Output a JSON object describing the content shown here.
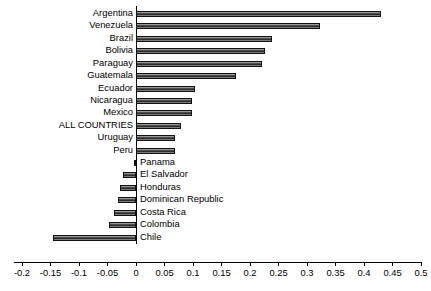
{
  "chart_data": {
    "type": "bar",
    "orientation": "horizontal",
    "title": "",
    "subtitle": "",
    "xlabel": "",
    "ylabel": "",
    "xlim": [
      -0.2,
      0.5
    ],
    "xticks": [
      -0.2,
      -0.15,
      -0.1,
      -0.05,
      0,
      0.05,
      0.1,
      0.15,
      0.2,
      0.25,
      0.3,
      0.35,
      0.4,
      0.45,
      0.5
    ],
    "xticklabels": [
      "-0.2",
      "-0.15",
      "-0.1",
      "-0.05",
      "0",
      "0.05",
      "0.1",
      "0.15",
      "0.2",
      "0.25",
      "0.3",
      "0.35",
      "0.4",
      "0.45",
      "0.5"
    ],
    "grid": false,
    "legend": null,
    "categories": [
      "Argentina",
      "Venezuela",
      "Brazil",
      "Bolivia",
      "Paraguay",
      "Guatemala",
      "Ecuador",
      "Nicaragua",
      "Mexico",
      "ALL COUNTRIES",
      "Uruguay",
      "Peru",
      "Panama",
      "El Salvador",
      "Honduras",
      "Dominican Republic",
      "Costa Rica",
      "Colombia",
      "Chile"
    ],
    "values": [
      0.43,
      0.323,
      0.239,
      0.227,
      0.221,
      0.175,
      0.104,
      0.098,
      0.098,
      0.079,
      0.068,
      0.068,
      -0.004,
      -0.023,
      -0.028,
      -0.032,
      -0.039,
      -0.048,
      -0.146
    ],
    "bar_fill_color": "#3f3f3f",
    "bar_edge_color": "#111111",
    "axis_color": "#000000",
    "background_color": "#ffffff"
  }
}
